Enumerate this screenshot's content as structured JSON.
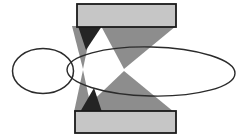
{
  "figure": {
    "canvas": {
      "width": 240,
      "height": 140,
      "background": "#ffffff"
    },
    "colors": {
      "bar_fill": "#c6c6c6",
      "bar_border": "#1a1a1a",
      "triangle_gray": "#8d8d8d",
      "triangle_dark": "#242424",
      "ellipse_stroke": "#2b2b2b"
    },
    "shapes": [
      {
        "type": "polygon",
        "name": "wide-down-triangle",
        "fill": "triangle_gray",
        "points": [
          [
            101,
            26
          ],
          [
            176,
            26
          ],
          [
            124,
            69
          ]
        ]
      },
      {
        "type": "polygon",
        "name": "wide-up-triangle",
        "fill": "triangle_gray",
        "points": [
          [
            81,
            112
          ],
          [
            174,
            112
          ],
          [
            124,
            71
          ]
        ]
      },
      {
        "type": "polygon",
        "name": "narrow-upper-triangle",
        "fill": "triangle_gray",
        "points": [
          [
            72,
            26
          ],
          [
            92,
            26
          ],
          [
            83,
            69
          ]
        ]
      },
      {
        "type": "polygon",
        "name": "narrow-lower-triangle",
        "fill": "triangle_gray",
        "points": [
          [
            74,
            112
          ],
          [
            92,
            112
          ],
          [
            83,
            70
          ]
        ]
      },
      {
        "type": "polygon",
        "name": "dark-upper-triangle",
        "fill": "triangle_dark",
        "points": [
          [
            78,
            26
          ],
          [
            102,
            26
          ],
          [
            86,
            50
          ]
        ]
      },
      {
        "type": "polygon",
        "name": "dark-lower-triangle",
        "fill": "triangle_dark",
        "points": [
          [
            80,
            112
          ],
          [
            102,
            112
          ],
          [
            94,
            88
          ]
        ]
      },
      {
        "type": "rect",
        "name": "top-bar",
        "x": 77,
        "y": 4,
        "width": 99,
        "height": 23,
        "fill": "bar_fill",
        "stroke": "bar_border",
        "strokeWidth": 1.8
      },
      {
        "type": "rect",
        "name": "bottom-bar",
        "x": 75,
        "y": 111,
        "width": 101,
        "height": 22,
        "fill": "bar_fill",
        "stroke": "bar_border",
        "strokeWidth": 1.8
      },
      {
        "type": "ellipse",
        "name": "small-circle",
        "cx": 43,
        "cy": 71,
        "rx": 30.5,
        "ry": 22.5,
        "stroke": "ellipse_stroke",
        "strokeWidth": 1.5,
        "rotate": 0
      },
      {
        "type": "ellipse",
        "name": "large-ellipse",
        "cx": 151,
        "cy": 71.5,
        "rx": 84,
        "ry": 24.5,
        "stroke": "ellipse_stroke",
        "strokeWidth": 1.4,
        "rotate": 1.3
      }
    ]
  }
}
